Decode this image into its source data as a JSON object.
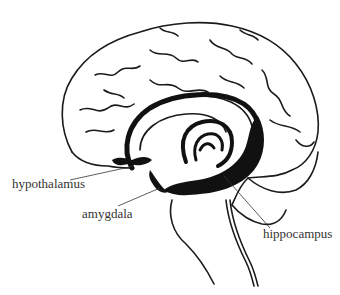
{
  "diagram": {
    "type": "anatomical illustration",
    "labels": [
      {
        "id": "hypothalamus",
        "text": "hypothalamus"
      },
      {
        "id": "amygdala",
        "text": "amygdala"
      },
      {
        "id": "hippocampus",
        "text": "hippocampus"
      }
    ],
    "colors": {
      "line": "#1a1a1a",
      "fill": "#111111",
      "text": "#333333",
      "background": "#ffffff"
    }
  }
}
